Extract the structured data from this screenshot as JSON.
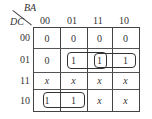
{
  "kmap": {
    "row_var": "DC",
    "col_var": "BA",
    "col_labels": [
      "00",
      "01",
      "11",
      "10"
    ],
    "row_labels": [
      "00",
      "01",
      "11",
      "10"
    ],
    "cells": [
      [
        "0",
        "0",
        "0",
        "0"
      ],
      [
        "0",
        "1",
        "1",
        "1"
      ],
      [
        "x",
        "x",
        "x",
        "x"
      ],
      [
        "1",
        "1",
        "x",
        "x"
      ]
    ],
    "groups": [
      {
        "row": "01",
        "cols": [
          "01",
          "11"
        ]
      },
      {
        "row": "01",
        "cols": [
          "11",
          "10"
        ]
      },
      {
        "row": "10",
        "cols": [
          "00",
          "01"
        ]
      }
    ]
  }
}
